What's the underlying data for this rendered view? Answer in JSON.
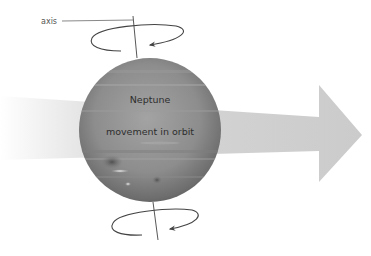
{
  "diagram": {
    "labels": {
      "axis": "axis",
      "planet": "Neptune",
      "orbit": "movement in orbit"
    },
    "elements": {
      "planet": {
        "name": "Neptune",
        "cx": 150,
        "cy": 130,
        "rx": 71,
        "ry": 72
      },
      "orbit_arrow": {
        "direction": "right",
        "color": "#cfcfcf"
      },
      "axis_line": {
        "top": [
          133,
          16
        ],
        "bottom": [
          158,
          240
        ]
      },
      "rotation_arrows": [
        "top",
        "bottom"
      ]
    },
    "colors": {
      "planet_base": "#8a8a8a",
      "planet_dark": "#555555",
      "orbit_arrow": "#cfcfcf",
      "line": "#444444",
      "text": "#333333"
    }
  }
}
